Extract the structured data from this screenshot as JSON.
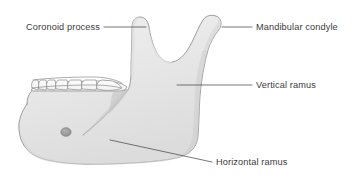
{
  "figure": {
    "background_color": "#ffffff",
    "bone_fill_color": "#e9e9e9",
    "bone_outline_color": "#8d8d8d",
    "label_text_color": "#3b3b3b",
    "leader_line_color": "#4a4a4a",
    "foramen_color": "#9a9a9a"
  },
  "labels": [
    {
      "id": "coronoid-process",
      "text": "Coronoid process",
      "side": "left",
      "text_x": 100,
      "text_y": 30,
      "leader_points": "104,27 146,27"
    },
    {
      "id": "mandibular-condyle",
      "text": "Mandibular condyle",
      "side": "right",
      "text_x": 256,
      "text_y": 30,
      "leader_points": "252,27 222,27"
    },
    {
      "id": "vertical-ramus",
      "text": "Vertical ramus",
      "side": "right",
      "text_x": 256,
      "text_y": 88,
      "leader_points": "252,85 177,85"
    },
    {
      "id": "horizontal-ramus",
      "text": "Horizontal ramus",
      "side": "right",
      "text_x": 216,
      "text_y": 165,
      "leader_points": "212,162 110,140"
    }
  ],
  "structures": [
    {
      "id": "mandible-body",
      "name": "horizontal ramus (body of mandible)"
    },
    {
      "id": "mandible-ramus",
      "name": "vertical ramus"
    },
    {
      "id": "coronoid-process-tip",
      "name": "coronoid process"
    },
    {
      "id": "condyle-head",
      "name": "mandibular condyle"
    },
    {
      "id": "mandibular-notch",
      "name": "mandibular notch"
    },
    {
      "id": "mental-foramen",
      "name": "mental foramen"
    },
    {
      "id": "oblique-ridge",
      "name": "external oblique ridge"
    },
    {
      "id": "teeth-row",
      "name": "lower teeth row",
      "count": 7
    }
  ]
}
